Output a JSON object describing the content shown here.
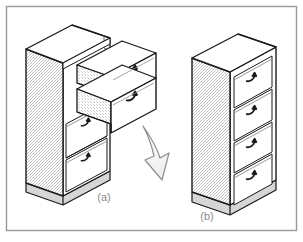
{
  "figure": {
    "background_color": "#ffffff",
    "frame": {
      "name": "figure-border",
      "color": "#9a9a9a",
      "x": 6,
      "y": 6,
      "width": 291,
      "height": 225
    },
    "captions": [
      {
        "id": "a",
        "label": "(a)",
        "x": 104,
        "y": 201
      },
      {
        "id": "b",
        "label": "(b)",
        "x": 207,
        "y": 220
      }
    ],
    "colors": {
      "outline": "#1a1a1a",
      "thin_line": "#555555",
      "side_panel_fill": "#dcdcdc",
      "top_panel_fill": "#ffffff",
      "drawer_front_fill": "#ffffff",
      "drawer_side_fill": "#d8d8d8",
      "plinth_fill": "#d0d0d0",
      "arrow_fill": "#f2f2f2",
      "arrow_stroke": "#8c8c8c",
      "caption_color": "#8a8a8a"
    },
    "objects": [
      {
        "name": "cabinet-a",
        "caption": "(a)",
        "description": "Chest of drawers with the two upper drawers pulled out",
        "drawer_count": 4,
        "open_drawers": 2,
        "closed_drawers": 2,
        "handle_count": 4
      },
      {
        "name": "cabinet-b",
        "caption": "(b)",
        "description": "Chest of drawers fully closed",
        "drawer_count": 4,
        "open_drawers": 0,
        "closed_drawers": 4,
        "handle_count": 4
      }
    ],
    "arrow": {
      "name": "transform-arrow",
      "direction": "down-right",
      "from": "cabinet-a",
      "to": "cabinet-b"
    }
  }
}
